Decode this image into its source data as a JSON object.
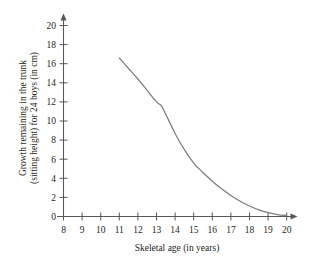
{
  "chart_data": {
    "type": "line",
    "title": "",
    "subtitle": "",
    "xlabel": "Skeletal age (in years)",
    "ylabel": "Growth remaining in the trunk (sitting height) for 24 boys (in cm)",
    "ylabel_line1": "Growth remaining in the trunk",
    "ylabel_line2": "(sitting height) for 24 boys (in cm)",
    "xlim": [
      8,
      20
    ],
    "ylim": [
      0,
      20
    ],
    "xticks": [
      8,
      9,
      10,
      11,
      12,
      13,
      14,
      15,
      16,
      17,
      18,
      19,
      20
    ],
    "yticks": [
      0,
      2,
      4,
      6,
      8,
      10,
      12,
      14,
      16,
      18,
      20
    ],
    "xtick_labels": [
      "8",
      "9",
      "10",
      "11",
      "12",
      "13",
      "14",
      "15",
      "16",
      "17",
      "18",
      "19",
      "20"
    ],
    "ytick_labels": [
      "0",
      "2",
      "4",
      "6",
      "8",
      "10",
      "12",
      "14",
      "16",
      "18",
      "20"
    ],
    "grid": false,
    "legend": false,
    "legend_position": "none",
    "axis_color": "#58585a",
    "curve_color": "#7d7d80",
    "background_color": "#ffffff",
    "series": [
      {
        "name": "Growth remaining in trunk",
        "x": [
          11.0,
          11.5,
          12.0,
          12.5,
          13.0,
          13.25,
          13.5,
          14.0,
          14.5,
          15.0,
          15.5,
          16.0,
          16.5,
          17.0,
          17.5,
          18.0,
          18.5,
          19.0,
          19.5,
          20.0
        ],
        "values": [
          16.6,
          15.5,
          14.4,
          13.2,
          12.0,
          11.6,
          10.7,
          8.7,
          7.0,
          5.6,
          4.6,
          3.7,
          2.9,
          2.2,
          1.6,
          1.1,
          0.7,
          0.4,
          0.2,
          0.1
        ]
      }
    ]
  }
}
